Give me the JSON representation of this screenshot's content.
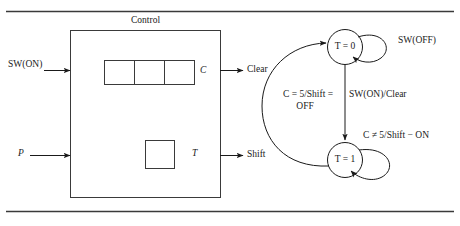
{
  "figure": {
    "title": "Control",
    "block_diagram": {
      "box_label": "Control",
      "inputs": [
        {
          "name": "sw-on-input",
          "label": "SW(ON)"
        },
        {
          "name": "p-input",
          "label": "P"
        }
      ],
      "outputs": [
        {
          "name": "clear-output",
          "label": "Clear"
        },
        {
          "name": "shift-output",
          "label": "Shift"
        }
      ],
      "internal": [
        {
          "name": "counter-register",
          "label": "C",
          "cells": 3
        },
        {
          "name": "toggle-register",
          "label": "T",
          "cells": 1
        }
      ]
    },
    "state_machine": {
      "states": [
        {
          "name": "state-t-0",
          "label": "T = 0"
        },
        {
          "name": "state-t-1",
          "label": "T = 1"
        }
      ],
      "transitions": [
        {
          "name": "self-loop-t0",
          "label": "SW(OFF)"
        },
        {
          "name": "t0-to-t1",
          "label": "SW(ON)/Clear"
        },
        {
          "name": "self-loop-t1",
          "label": "C ≠ 5/Shift − ON"
        },
        {
          "name": "t1-to-t0",
          "label_line1": "C = 5/Shift =",
          "label_line2": "OFF"
        }
      ]
    }
  },
  "colors": {
    "ink": "#1a1a1a",
    "rule": "#3a3a3a",
    "background": "#ffffff"
  }
}
